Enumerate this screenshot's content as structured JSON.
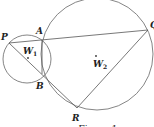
{
  "diagram": {
    "caption": "Figure 1",
    "circles": [
      {
        "name": "W1",
        "label_main": "W",
        "label_sub": "1",
        "cx": 27,
        "cy": 59,
        "r": 24
      },
      {
        "name": "W2",
        "label_main": "W",
        "label_sub": "2",
        "cx": 97,
        "cy": 54,
        "r": 56
      }
    ],
    "points": {
      "P": {
        "label": "P",
        "x": 9,
        "y": 43
      },
      "A": {
        "label": "A",
        "x": 42,
        "y": 40
      },
      "B": {
        "label": "B",
        "x": 42,
        "y": 74
      },
      "Q": {
        "label": "Q",
        "x": 148,
        "y": 30
      },
      "R": {
        "label": "R",
        "x": 77,
        "y": 108
      }
    },
    "segments": [
      [
        "P",
        "Q"
      ],
      [
        "P",
        "R"
      ],
      [
        "Q",
        "R"
      ],
      [
        "A",
        "B"
      ]
    ],
    "colors": {
      "stroke": "#555555",
      "text": "#222222",
      "background": "#ffffff"
    }
  }
}
